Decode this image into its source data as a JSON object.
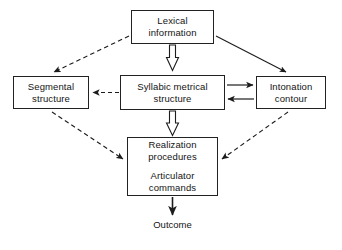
{
  "diagram": {
    "background_color": "#ffffff",
    "line_color": "#222222",
    "nodes": [
      {
        "id": "lexical",
        "lines": [
          "Lexical",
          "information"
        ],
        "shape": "rectangle"
      },
      {
        "id": "segmental",
        "lines": [
          "Segmental",
          "structure"
        ],
        "shape": "rectangle"
      },
      {
        "id": "syllabic",
        "lines": [
          "Syllabic metrical",
          "structure"
        ],
        "shape": "rectangle"
      },
      {
        "id": "intonation",
        "lines": [
          "Intonation",
          "contour"
        ],
        "shape": "rectangle"
      },
      {
        "id": "realization",
        "group_a": [
          "Realization",
          "procedures"
        ],
        "group_b": [
          "Articulator",
          "commands"
        ],
        "shape": "rectangle"
      },
      {
        "id": "outcome",
        "lines": [
          "Outcome"
        ],
        "shape": "plain-label"
      }
    ],
    "edges": [
      {
        "id": "lexical-to-segmental",
        "from": "lexical",
        "to": "segmental",
        "style": "dashed",
        "head": "single",
        "direction": "down-left"
      },
      {
        "id": "lexical-to-intonation",
        "from": "lexical",
        "to": "intonation",
        "style": "solid",
        "head": "single",
        "direction": "down-right"
      },
      {
        "id": "lexical-to-syllabic",
        "from": "lexical",
        "to": "syllabic",
        "style": "hollow",
        "head": "single",
        "direction": "down"
      },
      {
        "id": "syllabic-to-segmental",
        "from": "syllabic",
        "to": "segmental",
        "style": "dashed",
        "head": "single",
        "direction": "left"
      },
      {
        "id": "syllabic-to-intonation",
        "from": "syllabic",
        "to": "intonation",
        "style": "solid",
        "head": "single",
        "direction": "right"
      },
      {
        "id": "intonation-to-syllabic",
        "from": "intonation",
        "to": "syllabic",
        "style": "solid",
        "head": "single",
        "direction": "left"
      },
      {
        "id": "syllabic-to-realization",
        "from": "syllabic",
        "to": "realization",
        "style": "hollow",
        "head": "single",
        "direction": "down"
      },
      {
        "id": "segmental-to-realization",
        "from": "segmental",
        "to": "realization",
        "style": "dashed",
        "head": "single",
        "direction": "down-right"
      },
      {
        "id": "intonation-to-realization",
        "from": "intonation",
        "to": "realization",
        "style": "dashed",
        "head": "single",
        "direction": "down-left"
      },
      {
        "id": "realization-to-outcome",
        "from": "realization",
        "to": "outcome",
        "style": "solid",
        "head": "single",
        "direction": "down"
      }
    ]
  }
}
